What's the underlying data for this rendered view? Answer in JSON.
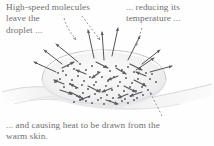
{
  "figure": {
    "name": "evaporative-cooling-droplet-diagram",
    "background_color": "#fefefe",
    "text_color": "#6f6f72",
    "ink_color": "#55555a",
    "droplet_fill": "#f2f2f3",
    "droplet_edge": "#c9c9cc",
    "skin_color": "#e6e6e8"
  },
  "captions": {
    "left": "High-speed molecules\nleave the\ndroplet ...",
    "right": "... reducing its\ntemperature ...",
    "bottom": "... and causing heat to be drawn from the\nwarm skin."
  },
  "annotations": {
    "leader_left_label": "dashed leader from left caption to droplet",
    "leader_right_label": "dashed leader from right caption to droplet",
    "leader_bottom_label": "dashed leader from bottom caption to skin"
  },
  "elements": {
    "droplet_label": "water droplet on skin",
    "skin_label": "warm skin surface",
    "molecule_label": "water molecule",
    "escape_arrow_label": "escaping high-speed molecule",
    "interior_arrow_label": "moving molecule inside droplet"
  },
  "chart_data": {
    "type": "diagram",
    "molecule_dots": [
      [
        63,
        71
      ],
      [
        68,
        66
      ],
      [
        74,
        69
      ],
      [
        80,
        64
      ],
      [
        86,
        70
      ],
      [
        92,
        66
      ],
      [
        98,
        72
      ],
      [
        104,
        67
      ],
      [
        110,
        71
      ],
      [
        116,
        66
      ],
      [
        122,
        70
      ],
      [
        128,
        67
      ],
      [
        134,
        72
      ],
      [
        140,
        68
      ],
      [
        146,
        73
      ],
      [
        60,
        79
      ],
      [
        66,
        75
      ],
      [
        72,
        80
      ],
      [
        78,
        76
      ],
      [
        84,
        81
      ],
      [
        90,
        77
      ],
      [
        96,
        82
      ],
      [
        102,
        77
      ],
      [
        108,
        81
      ],
      [
        114,
        77
      ],
      [
        120,
        82
      ],
      [
        126,
        78
      ],
      [
        132,
        83
      ],
      [
        138,
        79
      ],
      [
        144,
        84
      ],
      [
        150,
        79
      ],
      [
        64,
        87
      ],
      [
        70,
        84
      ],
      [
        76,
        88
      ],
      [
        82,
        85
      ],
      [
        88,
        89
      ],
      [
        94,
        85
      ],
      [
        100,
        90
      ],
      [
        106,
        86
      ],
      [
        112,
        90
      ],
      [
        118,
        86
      ],
      [
        124,
        91
      ],
      [
        130,
        87
      ],
      [
        136,
        91
      ],
      [
        142,
        87
      ],
      [
        148,
        90
      ],
      [
        71,
        94
      ],
      [
        77,
        96
      ],
      [
        83,
        93
      ],
      [
        89,
        97
      ],
      [
        95,
        94
      ],
      [
        101,
        98
      ],
      [
        107,
        95
      ],
      [
        113,
        98
      ],
      [
        119,
        95
      ],
      [
        125,
        99
      ],
      [
        131,
        96
      ],
      [
        137,
        98
      ],
      [
        143,
        95
      ],
      [
        86,
        101
      ],
      [
        92,
        103
      ],
      [
        98,
        100
      ],
      [
        104,
        104
      ],
      [
        110,
        101
      ],
      [
        116,
        104
      ],
      [
        122,
        101
      ],
      [
        128,
        103
      ],
      [
        58,
        73
      ],
      [
        55,
        82
      ],
      [
        152,
        74
      ],
      [
        156,
        82
      ],
      [
        134,
        100
      ],
      [
        80,
        100
      ],
      [
        74,
        102
      ]
    ],
    "interior_arrows": [
      [
        62,
        68,
        74,
        62
      ],
      [
        86,
        74,
        76,
        70
      ],
      [
        96,
        62,
        108,
        68
      ],
      [
        118,
        76,
        108,
        80
      ],
      [
        130,
        64,
        142,
        70
      ],
      [
        64,
        84,
        54,
        80
      ],
      [
        88,
        86,
        100,
        92
      ],
      [
        112,
        88,
        102,
        92
      ],
      [
        134,
        80,
        146,
        86
      ],
      [
        70,
        92,
        82,
        98
      ],
      [
        100,
        72,
        92,
        78
      ],
      [
        124,
        86,
        136,
        92
      ],
      [
        142,
        92,
        130,
        96
      ],
      [
        78,
        88,
        70,
        84
      ],
      [
        106,
        100,
        118,
        104
      ],
      [
        90,
        96,
        80,
        100
      ],
      [
        146,
        76,
        136,
        72
      ],
      [
        116,
        68,
        126,
        74
      ],
      [
        60,
        90,
        72,
        94
      ],
      [
        128,
        94,
        118,
        98
      ]
    ],
    "escape_arrows": [
      [
        78,
        62,
        56,
        44
      ],
      [
        94,
        58,
        88,
        30
      ],
      [
        112,
        56,
        118,
        28
      ],
      [
        128,
        60,
        140,
        36
      ],
      [
        142,
        64,
        160,
        50
      ],
      [
        150,
        72,
        172,
        66
      ],
      [
        56,
        72,
        34,
        62
      ],
      [
        62,
        64,
        44,
        50
      ],
      [
        104,
        60,
        102,
        32
      ],
      [
        136,
        70,
        154,
        58
      ]
    ],
    "dashed_leaders": [
      {
        "path": "M 64,18 C 66,26 70,32 76,40",
        "head": [
          76,
          40
        ]
      },
      {
        "path": "M 82,16 C 88,24 94,32 100,40",
        "head": [
          100,
          40
        ]
      },
      {
        "path": "M 142,28 C 140,34 138,40 136,46",
        "head": [
          136,
          46
        ]
      },
      {
        "path": "M 162,116 C 158,108 154,100 150,92",
        "head": [
          150,
          92
        ]
      }
    ]
  }
}
